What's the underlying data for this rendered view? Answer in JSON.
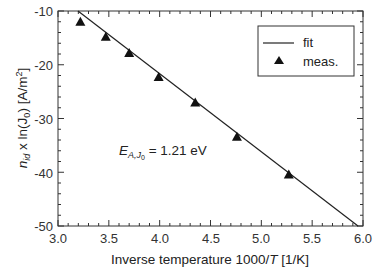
{
  "chart_data": {
    "type": "scatter",
    "title": "",
    "xlabel": "Inverse temperature 1000/T [1/K]",
    "ylabel": "n_id x ln(J_0) [A/m^2]",
    "xlim": [
      3.0,
      6.0
    ],
    "ylim": [
      -50,
      -10
    ],
    "xticks": [
      "3.0",
      "3.5",
      "4.0",
      "4.5",
      "5.0",
      "5.5",
      "6.0"
    ],
    "yticks": [
      "-10",
      "-20",
      "-30",
      "-40",
      "-50"
    ],
    "grid": false,
    "legend_position": "upper right",
    "series": [
      {
        "name": "fit",
        "kind": "line",
        "x": [
          3.2,
          5.95
        ],
        "y": [
          -10,
          -50
        ]
      },
      {
        "name": "meas.",
        "kind": "marker-triangle",
        "x": [
          3.22,
          3.47,
          3.7,
          3.99,
          4.35,
          4.76,
          5.27
        ],
        "y": [
          -12.0,
          -14.8,
          -17.8,
          -22.3,
          -27.0,
          -33.4,
          -40.4
        ]
      }
    ],
    "annotations": [
      {
        "text": "E_A,J0 = 1.21 eV",
        "x": 3.55,
        "y": -32
      }
    ]
  },
  "labels": {
    "xlabel_prefix": "Inverse temperature 1000/",
    "xlabel_var": "T",
    "xlabel_unit": " [1/K]",
    "ylabel_n": "n",
    "ylabel_sub": "id",
    "ylabel_mid": " x ln(J",
    "ylabel_sub0": "0",
    "ylabel_end": ") [A/m",
    "ylabel_sup": "2",
    "ylabel_close": "]",
    "annotation_E": "E",
    "annotation_sub": "A,J",
    "annotation_sub0": "0",
    "annotation_value": " = 1.21 eV",
    "legend_fit": "fit",
    "legend_meas": "meas.",
    "x_tick_labels": [
      "3.0",
      "3.5",
      "4.0",
      "4.5",
      "5.0",
      "5.5",
      "6.0"
    ],
    "y_tick_labels": [
      "-10",
      "-20",
      "-30",
      "-40",
      "-50"
    ]
  }
}
